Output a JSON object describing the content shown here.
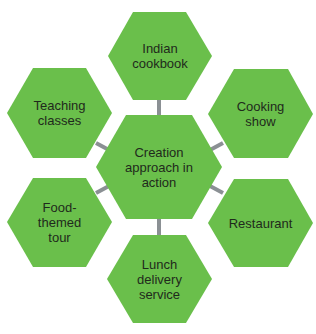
{
  "colors": {
    "hex_fill": "#6abf4b",
    "connector": "#8b9094",
    "text": "#1f2a1c"
  },
  "center": {
    "label": "Creation\napproach in\naction"
  },
  "nodes": [
    {
      "id": "indian-cookbook",
      "label": "Indian\ncookbook"
    },
    {
      "id": "cooking-show",
      "label": "Cooking\nshow"
    },
    {
      "id": "restaurant",
      "label": "Restaurant"
    },
    {
      "id": "lunch-delivery-service",
      "label": "Lunch\ndelivery\nservice"
    },
    {
      "id": "food-themed-tour",
      "label": "Food-\nthemed\ntour"
    },
    {
      "id": "teaching-classes",
      "label": "Teaching\nclasses"
    }
  ]
}
